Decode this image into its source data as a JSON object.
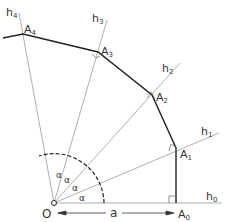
{
  "diagram": {
    "title": "",
    "origin_label": "O",
    "distance_label": "a",
    "angle_label": "α",
    "ray_labels": [
      "h0",
      "h1",
      "h2",
      "h3",
      "h4"
    ],
    "point_labels": [
      "A0",
      "A1",
      "A2",
      "A3",
      "A4"
    ],
    "colors": {
      "polyline": "#222222",
      "rays": "#9a9a9a",
      "text": "#333333"
    }
  },
  "labels": {
    "O": "O",
    "a": "a",
    "h0": "h",
    "h0s": "0",
    "h1": "h",
    "h1s": "1",
    "h2": "h",
    "h2s": "2",
    "h3": "h",
    "h3s": "3",
    "h4": "h",
    "h4s": "4",
    "A0": "A",
    "A0s": "0",
    "A1": "A",
    "A1s": "1",
    "A2": "A",
    "A2s": "2",
    "A3": "A",
    "A3s": "3",
    "A4": "A",
    "A4s": "4",
    "alpha1": "α",
    "alpha2": "α",
    "alpha3": "α",
    "alpha4": "α"
  }
}
